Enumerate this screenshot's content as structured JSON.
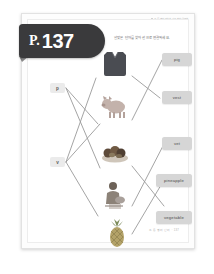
{
  "page": {
    "tab_prefix": "P.",
    "tab_number": "137",
    "instruction": "알맞은 단어를 찾아 선으로 연결하세요.",
    "header_note": "초등 영어 파닉스 기초 학습 워크북",
    "footer": "초등 영어 단어 · 137"
  },
  "letters": [
    {
      "label": "p",
      "name": "letter-chip-p"
    },
    {
      "label": "v",
      "name": "letter-chip-v"
    }
  ],
  "pictures": [
    {
      "name": "vest-image",
      "alt": "vest",
      "color": "#4a4c52"
    },
    {
      "name": "pig-image",
      "alt": "pig",
      "color": "#b9a9a2"
    },
    {
      "name": "vegetable-image",
      "alt": "vegetable",
      "color": "#6f6052"
    },
    {
      "name": "vet-image",
      "alt": "vet",
      "color": "#8a7d72"
    },
    {
      "name": "pineapple-image",
      "alt": "pineapple",
      "color": "#a89a5e"
    }
  ],
  "words": [
    {
      "label": "pig",
      "name": "word-chip-pig"
    },
    {
      "label": "vest",
      "name": "word-chip-vest"
    },
    {
      "label": "vet",
      "name": "word-chip-vet"
    },
    {
      "label": "pineapple",
      "name": "word-chip-pineapple"
    },
    {
      "label": "vegetable",
      "name": "word-chip-vegetable"
    }
  ],
  "colors": {
    "tab_background": "#3a3a3c",
    "chip_background": "#d6d6d6",
    "line": "#9a9a9a",
    "sheet": "#ffffff"
  }
}
